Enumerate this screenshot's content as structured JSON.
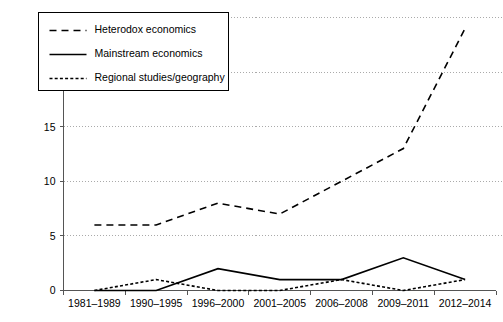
{
  "chart_data": {
    "type": "line",
    "title": "",
    "xlabel": "",
    "ylabel": "",
    "categories": [
      "1981–1989",
      "1990–1995",
      "1996–2000",
      "2001–2005",
      "2006–2008",
      "2009–2011",
      "2012–2014"
    ],
    "ylim": [
      0,
      25
    ],
    "yticks": [
      0,
      5,
      10,
      15,
      20,
      25
    ],
    "grid": true,
    "legend_position": "top-left",
    "series": [
      {
        "name": "Heterodox economics",
        "style": "dashed",
        "values": [
          6,
          6,
          8,
          7,
          10,
          13,
          24
        ]
      },
      {
        "name": "Mainstream economics",
        "style": "solid",
        "values": [
          0,
          0,
          2,
          1,
          1,
          3,
          1
        ]
      },
      {
        "name": "Regional studies/geography",
        "style": "dotted",
        "values": [
          0,
          1,
          0,
          0,
          1,
          0,
          1
        ]
      }
    ]
  },
  "legend": {
    "items": [
      {
        "label": "Heterodox economics",
        "style": "dashed"
      },
      {
        "label": "Mainstream economics",
        "style": "solid"
      },
      {
        "label": "Regional studies/geography",
        "style": "dotted"
      }
    ]
  },
  "axes": {
    "y_tick_labels": [
      "0",
      "5",
      "10",
      "15",
      "20",
      "25"
    ],
    "x_tick_labels": [
      "1981–1989",
      "1990–1995",
      "1996–2000",
      "2001–2005",
      "2006–2008",
      "2009–2011",
      "2012–2014"
    ]
  },
  "colors": {
    "line": "#000000",
    "axis": "#555555",
    "grid": "#aaaaaa",
    "background": "#ffffff"
  }
}
